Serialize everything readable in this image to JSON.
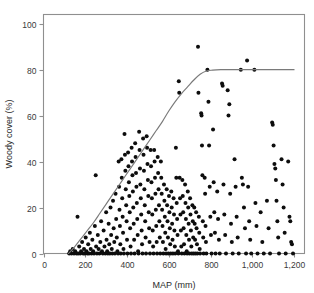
{
  "chart_data": {
    "type": "scatter",
    "title": "",
    "xlabel": "MAP (mm)",
    "ylabel": "Woody cover (%)",
    "xlim": [
      0,
      1250
    ],
    "ylim": [
      0,
      104
    ],
    "grid": false,
    "legend": null,
    "xticks": [
      0,
      200,
      400,
      600,
      800,
      1000,
      1200
    ],
    "xtick_labels": [
      "0",
      "200",
      "400",
      "600",
      "800",
      "1,000",
      "1,200"
    ],
    "yticks": [
      0,
      20,
      40,
      60,
      80,
      100
    ],
    "ytick_labels": [
      "0",
      "20",
      "40",
      "60",
      "80",
      "100"
    ],
    "marker": "filled-circle",
    "marker_color": "#0d0d0d",
    "marker_size_px": 4.0,
    "curve": {
      "name": "upper-bound fit",
      "color": "#7a7a7a",
      "description": "Rising envelope from MAP 120 mm at 0% to an asymptote of 80% woody cover at about MAP 790 mm, flat thereafter to 1,200 mm",
      "x": [
        120,
        150,
        180,
        210,
        240,
        270,
        300,
        330,
        360,
        390,
        420,
        450,
        480,
        510,
        540,
        570,
        600,
        630,
        660,
        690,
        720,
        750,
        780,
        810,
        850,
        900,
        950,
        1000,
        1050,
        1100,
        1150,
        1200
      ],
      "y": [
        0,
        3,
        6.5,
        10,
        13.5,
        17.5,
        21.5,
        25.5,
        29.5,
        33.5,
        37.5,
        41.5,
        45.5,
        49.5,
        53.5,
        57.5,
        62,
        66,
        69.5,
        72.5,
        75.5,
        78,
        79.4,
        79.8,
        80,
        80,
        80,
        80,
        80,
        80,
        80,
        80
      ]
    },
    "points": [
      [
        123,
        0
      ],
      [
        128,
        1
      ],
      [
        134,
        0
      ],
      [
        140,
        2
      ],
      [
        146,
        0
      ],
      [
        152,
        1
      ],
      [
        158,
        0
      ],
      [
        163,
        16
      ],
      [
        166,
        0
      ],
      [
        171,
        3
      ],
      [
        176,
        0
      ],
      [
        180,
        1
      ],
      [
        185,
        5
      ],
      [
        190,
        0
      ],
      [
        194,
        2
      ],
      [
        198,
        0
      ],
      [
        202,
        7
      ],
      [
        206,
        1
      ],
      [
        210,
        0
      ],
      [
        214,
        4
      ],
      [
        218,
        0
      ],
      [
        222,
        9
      ],
      [
        226,
        2
      ],
      [
        230,
        0
      ],
      [
        234,
        6
      ],
      [
        238,
        1
      ],
      [
        242,
        0
      ],
      [
        246,
        12
      ],
      [
        250,
        34
      ],
      [
        252,
        3
      ],
      [
        256,
        0
      ],
      [
        260,
        8
      ],
      [
        264,
        2
      ],
      [
        268,
        0
      ],
      [
        272,
        5
      ],
      [
        276,
        14
      ],
      [
        280,
        1
      ],
      [
        284,
        0
      ],
      [
        288,
        10
      ],
      [
        292,
        3
      ],
      [
        296,
        0
      ],
      [
        300,
        18
      ],
      [
        302,
        6
      ],
      [
        305,
        1
      ],
      [
        308,
        0
      ],
      [
        312,
        13
      ],
      [
        315,
        4
      ],
      [
        318,
        0
      ],
      [
        321,
        20
      ],
      [
        324,
        8
      ],
      [
        327,
        2
      ],
      [
        330,
        0
      ],
      [
        333,
        23
      ],
      [
        336,
        11
      ],
      [
        339,
        5
      ],
      [
        342,
        0
      ],
      [
        345,
        26
      ],
      [
        348,
        15
      ],
      [
        351,
        7
      ],
      [
        354,
        1
      ],
      [
        357,
        0
      ],
      [
        360,
        40
      ],
      [
        362,
        29
      ],
      [
        364,
        19
      ],
      [
        366,
        12
      ],
      [
        368,
        4
      ],
      [
        370,
        0
      ],
      [
        373,
        41
      ],
      [
        375,
        33
      ],
      [
        377,
        24
      ],
      [
        379,
        16
      ],
      [
        381,
        9
      ],
      [
        383,
        2
      ],
      [
        385,
        0
      ],
      [
        388,
        52
      ],
      [
        390,
        43
      ],
      [
        392,
        36
      ],
      [
        394,
        28
      ],
      [
        396,
        21
      ],
      [
        398,
        14
      ],
      [
        400,
        6
      ],
      [
        402,
        0
      ],
      [
        405,
        44
      ],
      [
        407,
        38
      ],
      [
        409,
        31
      ],
      [
        411,
        25
      ],
      [
        413,
        18
      ],
      [
        415,
        11
      ],
      [
        417,
        3
      ],
      [
        419,
        0
      ],
      [
        422,
        46
      ],
      [
        424,
        40
      ],
      [
        426,
        34
      ],
      [
        428,
        27
      ],
      [
        430,
        20
      ],
      [
        432,
        13
      ],
      [
        434,
        6
      ],
      [
        436,
        0
      ],
      [
        439,
        48
      ],
      [
        441,
        42
      ],
      [
        443,
        35
      ],
      [
        445,
        29
      ],
      [
        447,
        22
      ],
      [
        449,
        15
      ],
      [
        451,
        8
      ],
      [
        453,
        1
      ],
      [
        455,
        0
      ],
      [
        458,
        53
      ],
      [
        460,
        45
      ],
      [
        462,
        37
      ],
      [
        464,
        30
      ],
      [
        466,
        24
      ],
      [
        468,
        17
      ],
      [
        470,
        10
      ],
      [
        472,
        4
      ],
      [
        474,
        0
      ],
      [
        477,
        50
      ],
      [
        479,
        43
      ],
      [
        481,
        36
      ],
      [
        483,
        28
      ],
      [
        485,
        21
      ],
      [
        487,
        14
      ],
      [
        489,
        7
      ],
      [
        491,
        0
      ],
      [
        494,
        51
      ],
      [
        496,
        46
      ],
      [
        498,
        39
      ],
      [
        500,
        32
      ],
      [
        502,
        25
      ],
      [
        504,
        18
      ],
      [
        506,
        11
      ],
      [
        508,
        5
      ],
      [
        510,
        0
      ],
      [
        513,
        45
      ],
      [
        515,
        38
      ],
      [
        517,
        31
      ],
      [
        519,
        24
      ],
      [
        521,
        17
      ],
      [
        523,
        10
      ],
      [
        525,
        3
      ],
      [
        527,
        0
      ],
      [
        530,
        45
      ],
      [
        532,
        40
      ],
      [
        534,
        33
      ],
      [
        536,
        26
      ],
      [
        538,
        19
      ],
      [
        540,
        12
      ],
      [
        542,
        5
      ],
      [
        544,
        0
      ],
      [
        547,
        42
      ],
      [
        549,
        35
      ],
      [
        551,
        28
      ],
      [
        553,
        21
      ],
      [
        555,
        14
      ],
      [
        557,
        7
      ],
      [
        559,
        0
      ],
      [
        562,
        40
      ],
      [
        564,
        33
      ],
      [
        566,
        26
      ],
      [
        568,
        19
      ],
      [
        570,
        12
      ],
      [
        572,
        5
      ],
      [
        574,
        0
      ],
      [
        577,
        30
      ],
      [
        579,
        23
      ],
      [
        581,
        16
      ],
      [
        583,
        9
      ],
      [
        585,
        2
      ],
      [
        587,
        0
      ],
      [
        590,
        28
      ],
      [
        592,
        21
      ],
      [
        594,
        14
      ],
      [
        596,
        7
      ],
      [
        598,
        0
      ],
      [
        601,
        25
      ],
      [
        603,
        18
      ],
      [
        605,
        11
      ],
      [
        607,
        4
      ],
      [
        609,
        0
      ],
      [
        612,
        27
      ],
      [
        614,
        20
      ],
      [
        616,
        13
      ],
      [
        618,
        6
      ],
      [
        620,
        0
      ],
      [
        623,
        24
      ],
      [
        625,
        17
      ],
      [
        627,
        10
      ],
      [
        629,
        3
      ],
      [
        631,
        0
      ],
      [
        634,
        46
      ],
      [
        636,
        33
      ],
      [
        638,
        22
      ],
      [
        640,
        15
      ],
      [
        642,
        8
      ],
      [
        644,
        1
      ],
      [
        646,
        0
      ],
      [
        648,
        75
      ],
      [
        650,
        70
      ],
      [
        652,
        33
      ],
      [
        654,
        24
      ],
      [
        656,
        17
      ],
      [
        658,
        10
      ],
      [
        660,
        3
      ],
      [
        662,
        0
      ],
      [
        665,
        32
      ],
      [
        667,
        25
      ],
      [
        669,
        18
      ],
      [
        671,
        11
      ],
      [
        673,
        4
      ],
      [
        675,
        0
      ],
      [
        678,
        30
      ],
      [
        680,
        22
      ],
      [
        682,
        15
      ],
      [
        684,
        8
      ],
      [
        686,
        1
      ],
      [
        688,
        0
      ],
      [
        691,
        27
      ],
      [
        693,
        20
      ],
      [
        695,
        13
      ],
      [
        697,
        6
      ],
      [
        699,
        0
      ],
      [
        702,
        24
      ],
      [
        704,
        17
      ],
      [
        706,
        10
      ],
      [
        708,
        3
      ],
      [
        710,
        0
      ],
      [
        713,
        21
      ],
      [
        715,
        14
      ],
      [
        717,
        7
      ],
      [
        719,
        0
      ],
      [
        722,
        20
      ],
      [
        724,
        13
      ],
      [
        726,
        6
      ],
      [
        728,
        0
      ],
      [
        731,
        18
      ],
      [
        733,
        11
      ],
      [
        735,
        4
      ],
      [
        737,
        0
      ],
      [
        740,
        90
      ],
      [
        742,
        70
      ],
      [
        744,
        16
      ],
      [
        746,
        9
      ],
      [
        748,
        2
      ],
      [
        750,
        0
      ],
      [
        755,
        61
      ],
      [
        757,
        60
      ],
      [
        759,
        47
      ],
      [
        761,
        34
      ],
      [
        763,
        14
      ],
      [
        765,
        7
      ],
      [
        767,
        0
      ],
      [
        772,
        33
      ],
      [
        774,
        26
      ],
      [
        776,
        12
      ],
      [
        778,
        5
      ],
      [
        780,
        0
      ],
      [
        785,
        80
      ],
      [
        790,
        66
      ],
      [
        793,
        47
      ],
      [
        796,
        29
      ],
      [
        799,
        16
      ],
      [
        802,
        8
      ],
      [
        805,
        0
      ],
      [
        812,
        54
      ],
      [
        815,
        31
      ],
      [
        818,
        18
      ],
      [
        821,
        9
      ],
      [
        824,
        0
      ],
      [
        832,
        27
      ],
      [
        836,
        15
      ],
      [
        840,
        6
      ],
      [
        844,
        0
      ],
      [
        855,
        74
      ],
      [
        858,
        73
      ],
      [
        862,
        30
      ],
      [
        866,
        17
      ],
      [
        870,
        8
      ],
      [
        874,
        0
      ],
      [
        882,
        71
      ],
      [
        886,
        60
      ],
      [
        890,
        65
      ],
      [
        894,
        26
      ],
      [
        898,
        13
      ],
      [
        902,
        5
      ],
      [
        906,
        0
      ],
      [
        915,
        41
      ],
      [
        920,
        29
      ],
      [
        925,
        16
      ],
      [
        930,
        7
      ],
      [
        935,
        0
      ],
      [
        945,
        80
      ],
      [
        950,
        33
      ],
      [
        955,
        30
      ],
      [
        960,
        20
      ],
      [
        965,
        11
      ],
      [
        970,
        0
      ],
      [
        975,
        84
      ],
      [
        980,
        29
      ],
      [
        985,
        14
      ],
      [
        990,
        6
      ],
      [
        995,
        0
      ],
      [
        1010,
        80
      ],
      [
        1015,
        22
      ],
      [
        1020,
        12
      ],
      [
        1025,
        0
      ],
      [
        1040,
        18
      ],
      [
        1048,
        5
      ],
      [
        1055,
        0
      ],
      [
        1070,
        23
      ],
      [
        1078,
        11
      ],
      [
        1085,
        0
      ],
      [
        1095,
        57
      ],
      [
        1098,
        56
      ],
      [
        1102,
        47
      ],
      [
        1106,
        39
      ],
      [
        1110,
        37
      ],
      [
        1113,
        32
      ],
      [
        1116,
        23
      ],
      [
        1120,
        14
      ],
      [
        1124,
        7
      ],
      [
        1128,
        0
      ],
      [
        1140,
        41
      ],
      [
        1145,
        30
      ],
      [
        1150,
        20
      ],
      [
        1155,
        9
      ],
      [
        1160,
        0
      ],
      [
        1172,
        40
      ],
      [
        1178,
        16
      ],
      [
        1182,
        14
      ],
      [
        1186,
        5
      ],
      [
        1190,
        4
      ],
      [
        1195,
        0
      ]
    ]
  }
}
